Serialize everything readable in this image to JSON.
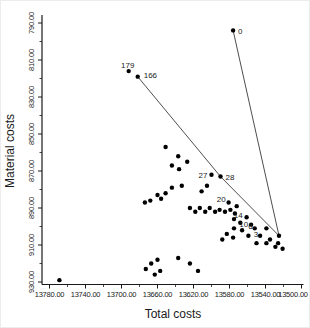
{
  "chart_data": {
    "type": "scatter",
    "title": "",
    "xlabel": "Total costs",
    "ylabel": "Material costs",
    "x_axis": {
      "tick_values": [
        13780,
        13740,
        13700,
        13660,
        13620,
        13580,
        13540,
        13500
      ],
      "tick_labels": [
        "13780.00",
        "13740.00",
        "13700.00",
        "13660.00",
        "13620.00",
        "13580.00",
        "13540.00",
        "13500.00"
      ],
      "direction": "decreasing-rightward",
      "minor_ticks_between": 1
    },
    "y_axis": {
      "tick_values": [
        790,
        810,
        830,
        850,
        870,
        890,
        910,
        930
      ],
      "tick_labels": [
        "790.00",
        "810.00",
        "830.00",
        "850.00",
        "870.00",
        "890.00",
        "910.00",
        "930.00"
      ],
      "direction": "increasing-downward",
      "minor_ticks_between": 1
    },
    "grid": false,
    "legend": false,
    "point_color": "#000000",
    "line_color": "#3a3a3a",
    "labeled_points": [
      {
        "label": "0",
        "x": 13576,
        "y": 794,
        "dx": 5,
        "dy": 2,
        "anchor": "start"
      },
      {
        "label": "179",
        "x": 13692,
        "y": 816,
        "dx": -1,
        "dy": -5,
        "anchor": "middle"
      },
      {
        "label": "166",
        "x": 13682,
        "y": 819,
        "dx": 6,
        "dy": -1,
        "anchor": "start"
      },
      {
        "label": "27",
        "x": 13600,
        "y": 872,
        "dx": -4,
        "dy": 1,
        "anchor": "end"
      },
      {
        "label": "28",
        "x": 13590,
        "y": 873,
        "dx": 5,
        "dy": 1,
        "anchor": "start"
      },
      {
        "label": "20",
        "x": 13581,
        "y": 887,
        "dx": -3,
        "dy": -2,
        "anchor": "end"
      },
      {
        "label": "14",
        "x": 13561,
        "y": 895,
        "dx": -4,
        "dy": -1,
        "anchor": "end"
      },
      {
        "label": "10",
        "x": 13556,
        "y": 899,
        "dx": -3,
        "dy": 0,
        "anchor": "end"
      },
      {
        "label": "6",
        "x": 13552,
        "y": 901,
        "dx": -2,
        "dy": -1,
        "anchor": "end"
      },
      {
        "label": "3",
        "x": 13546,
        "y": 905,
        "dx": -2,
        "dy": -1,
        "anchor": "end"
      }
    ],
    "trajectory_lines": [
      {
        "points": [
          [
            13682,
            819
          ],
          [
            13590,
            873
          ],
          [
            13525,
            905
          ]
        ]
      },
      {
        "points": [
          [
            13576,
            794
          ],
          [
            13525,
            905
          ]
        ]
      }
    ],
    "points": [
      [
        13769,
        929
      ],
      [
        13651,
        857
      ],
      [
        13637,
        862
      ],
      [
        13627,
        865
      ],
      [
        13644,
        867
      ],
      [
        13636,
        869
      ],
      [
        13644,
        879
      ],
      [
        13633,
        878
      ],
      [
        13651,
        882
      ],
      [
        13660,
        883
      ],
      [
        13668,
        886
      ],
      [
        13674,
        887
      ],
      [
        13656,
        885
      ],
      [
        13611,
        881
      ],
      [
        13605,
        878
      ],
      [
        13624,
        890
      ],
      [
        13618,
        892
      ],
      [
        13613,
        890
      ],
      [
        13607,
        892
      ],
      [
        13602,
        890
      ],
      [
        13596,
        892
      ],
      [
        13591,
        891
      ],
      [
        13585,
        892
      ],
      [
        13579,
        891
      ],
      [
        13574,
        893
      ],
      [
        13660,
        918
      ],
      [
        13667,
        920
      ],
      [
        13673,
        923
      ],
      [
        13657,
        924
      ],
      [
        13663,
        926
      ],
      [
        13637,
        917
      ],
      [
        13624,
        920
      ],
      [
        13615,
        924
      ],
      [
        13583,
        904
      ],
      [
        13576,
        906
      ],
      [
        13588,
        907
      ],
      [
        13572,
        889
      ],
      [
        13575,
        896
      ],
      [
        13568,
        898
      ],
      [
        13575,
        901
      ],
      [
        13566,
        902
      ],
      [
        13559,
        905
      ],
      [
        13550,
        909
      ],
      [
        13539,
        909
      ],
      [
        13529,
        911
      ],
      [
        13539,
        901
      ],
      [
        13535,
        907
      ],
      [
        13526,
        909
      ],
      [
        13521,
        912
      ],
      [
        13525,
        905
      ]
    ]
  }
}
